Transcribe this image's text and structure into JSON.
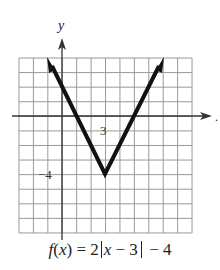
{
  "chart_data": {
    "type": "line",
    "title": "",
    "caption": "f(x) = 2|x − 3| − 4",
    "function": "f(x) = 2|x - 3| - 4",
    "xlabel": "x",
    "ylabel": "y",
    "xlim": [
      -3,
      9
    ],
    "ylim": [
      -8,
      4
    ],
    "grid": true,
    "grid_step": 1,
    "tick_labels": [
      {
        "axis": "x",
        "value": 3,
        "label": "3"
      },
      {
        "axis": "y",
        "value": -4,
        "label": "−4"
      }
    ],
    "series": [
      {
        "name": "f(x) = 2|x - 3| - 4",
        "points": [
          {
            "x": -1,
            "y": 4
          },
          {
            "x": 3,
            "y": -4
          },
          {
            "x": 7,
            "y": 4
          }
        ],
        "arrows": "both-ends"
      }
    ],
    "vertex": {
      "x": 3,
      "y": -4
    }
  },
  "labels": {
    "y_axis": "y",
    "x_axis": "x",
    "tick_x3": "3",
    "tick_y_neg4": "−4",
    "caption_prefix": "f",
    "caption_var": "x",
    "caption_eq1": ") = 2",
    "caption_var2": "x",
    "caption_eq2": " − 3",
    "caption_eq3": " − 4"
  },
  "colors": {
    "grid": "#9a9a9a",
    "axis": "#333333",
    "curve": "#111111",
    "text": "#222222"
  }
}
